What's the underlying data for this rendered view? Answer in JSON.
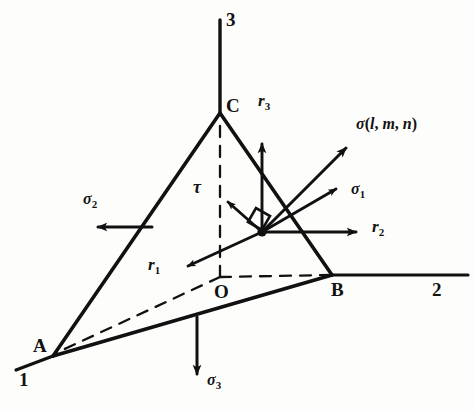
{
  "figure": {
    "caption": "Stress tetrahedron with resultant stress and components",
    "ink_color": "#111111",
    "background_color": "#fdfdfb"
  },
  "axes": [
    {
      "id": "axis-3",
      "label": "3",
      "x": 232,
      "y": 16,
      "orientation": "vertical-up"
    },
    {
      "id": "axis-2",
      "label": "2",
      "x": 436,
      "y": 282,
      "orientation": "horizontal-right"
    },
    {
      "id": "axis-1",
      "label": "1",
      "x": 21,
      "y": 372,
      "orientation": "oblique-down-left"
    }
  ],
  "vertices": [
    {
      "id": "vertex-A",
      "label": "A",
      "x": 35,
      "y": 338,
      "point_x": 53,
      "point_y": 356
    },
    {
      "id": "vertex-B",
      "label": "B",
      "x": 333,
      "y": 282,
      "point_x": 332,
      "point_y": 275
    },
    {
      "id": "vertex-C",
      "label": "C",
      "x": 228,
      "y": 98,
      "point_x": 220,
      "point_y": 113
    },
    {
      "id": "vertex-O",
      "label": "O",
      "x": 216,
      "y": 284,
      "point_x": 220,
      "point_y": 277
    }
  ],
  "vectors": [
    {
      "id": "vector-sigma-lmn",
      "label_parts": {
        "greek": "σ",
        "open": "(",
        "l": "l",
        "comma1": ", ",
        "m": "m",
        "comma2": ", ",
        "n": "n",
        "close": ")"
      },
      "label_text": "σ(l, m, n)",
      "label_x": 358,
      "label_y": 118,
      "from": [
        262,
        232
      ],
      "to": [
        348,
        146
      ],
      "kind": "resultant-stress"
    },
    {
      "id": "vector-sigma-1",
      "label_text": "σ",
      "subscript": "1",
      "label_x": 352,
      "label_y": 183,
      "from": [
        262,
        232
      ],
      "to": [
        338,
        188
      ],
      "kind": "normal-stress"
    },
    {
      "id": "vector-sigma-2",
      "label_text": "σ",
      "subscript": "2",
      "label_x": 84,
      "label_y": 193,
      "from": [
        152,
        227
      ],
      "to": [
        93,
        227
      ],
      "kind": "normal-stress"
    },
    {
      "id": "vector-sigma-3",
      "label_text": "σ",
      "subscript": "3",
      "label_x": 208,
      "label_y": 374,
      "from": [
        197,
        318
      ],
      "to": [
        197,
        378
      ],
      "kind": "normal-stress"
    },
    {
      "id": "vector-tau",
      "label_text": "τ",
      "label_x": 194,
      "label_y": 180,
      "from": [
        262,
        232
      ],
      "to": [
        226,
        200
      ],
      "kind": "shear-stress"
    },
    {
      "id": "vector-r-1",
      "label_text": "r",
      "subscript": "1",
      "label_x": 150,
      "label_y": 258,
      "from": [
        262,
        232
      ],
      "to": [
        184,
        268
      ],
      "kind": "direction-axis"
    },
    {
      "id": "vector-r-2",
      "label_text": "r",
      "subscript": "2",
      "label_x": 374,
      "label_y": 220,
      "from": [
        262,
        232
      ],
      "to": [
        360,
        232
      ],
      "kind": "direction-axis"
    },
    {
      "id": "vector-r-3",
      "label_text": "r",
      "subscript": "3",
      "label_x": 260,
      "label_y": 94,
      "from": [
        262,
        232
      ],
      "to": [
        262,
        140
      ],
      "kind": "direction-axis"
    }
  ],
  "markers": [
    {
      "id": "right-angle-marker",
      "x": 248,
      "y": 207,
      "size": 20
    },
    {
      "id": "stress-point",
      "x": 262,
      "y": 232,
      "radius": 4
    }
  ]
}
